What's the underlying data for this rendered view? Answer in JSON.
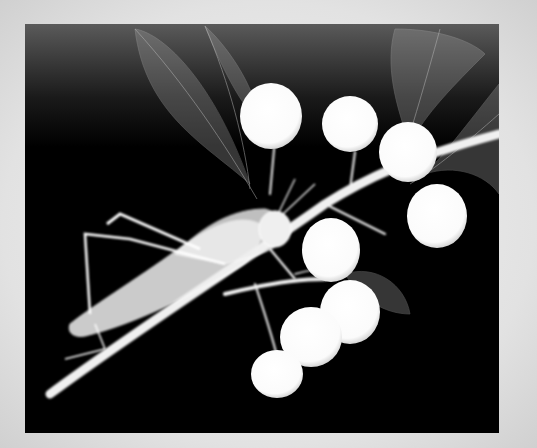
{
  "image": {
    "description": "X-ray photograph of a grasshopper perched on a branch with round fruits and translucent leaves",
    "subjects": [
      "grasshopper",
      "branch",
      "fruits",
      "leaves"
    ],
    "colors": {
      "background": "#000000",
      "frame": "#e0e0e0",
      "subject": "#ffffff"
    }
  }
}
